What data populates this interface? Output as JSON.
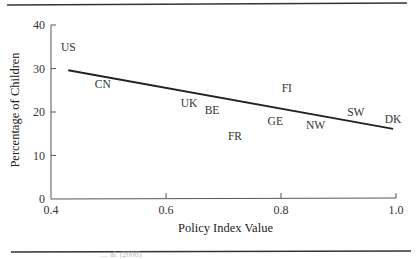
{
  "chart_data": {
    "type": "scatter",
    "title": "",
    "xlabel": "Policy Index Value",
    "ylabel": "Percentage of Children",
    "xlim": [
      0.4,
      1.0
    ],
    "ylim": [
      0,
      40
    ],
    "xticks": [
      0.4,
      0.6,
      0.8,
      1.0
    ],
    "xtick_labels": [
      "0.4",
      "0.6",
      "0.8",
      "1.0"
    ],
    "yticks": [
      0,
      10,
      20,
      30,
      40
    ],
    "ytick_labels": [
      "0",
      "10",
      "20",
      "30",
      "40"
    ],
    "grid": false,
    "legend": "none",
    "marker": "text-label",
    "points": [
      {
        "label": "US",
        "x": 0.43,
        "y": 35
      },
      {
        "label": "CN",
        "x": 0.49,
        "y": 26.5
      },
      {
        "label": "UK",
        "x": 0.64,
        "y": 22
      },
      {
        "label": "BE",
        "x": 0.68,
        "y": 20.5
      },
      {
        "label": "FR",
        "x": 0.72,
        "y": 14.5
      },
      {
        "label": "GE",
        "x": 0.79,
        "y": 18
      },
      {
        "label": "FI",
        "x": 0.81,
        "y": 25.5
      },
      {
        "label": "NW",
        "x": 0.86,
        "y": 17
      },
      {
        "label": "SW",
        "x": 0.93,
        "y": 20
      },
      {
        "label": "DK",
        "x": 0.995,
        "y": 18.5
      }
    ],
    "trend_line": {
      "x": [
        0.43,
        0.995
      ],
      "y": [
        29.6,
        16.1
      ]
    }
  },
  "source_note": "… al. (2006)"
}
